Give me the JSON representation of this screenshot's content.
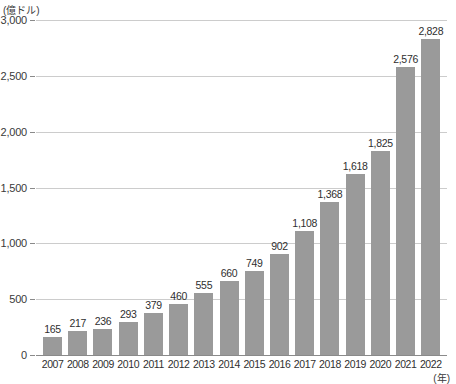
{
  "chart_data": {
    "type": "bar",
    "title": "",
    "subtitle": "",
    "xlabel": "(年)",
    "ylabel": "(億ドル)",
    "categories": [
      "2007",
      "2008",
      "2009",
      "2010",
      "2011",
      "2012",
      "2013",
      "2014",
      "2015",
      "2016",
      "2017",
      "2018",
      "2019",
      "2020",
      "2021",
      "2022"
    ],
    "values": [
      165,
      217,
      236,
      293,
      379,
      460,
      555,
      660,
      749,
      902,
      1108,
      1368,
      1618,
      1825,
      2576,
      2828
    ],
    "value_labels": [
      "165",
      "217",
      "236",
      "293",
      "379",
      "460",
      "555",
      "660",
      "749",
      "902",
      "1,108",
      "1,368",
      "1,618",
      "1,825",
      "2,576",
      "2,828"
    ],
    "ylim": [
      0,
      3000
    ],
    "yticks": [
      0,
      500,
      1000,
      1500,
      2000,
      2500,
      3000
    ],
    "ytick_labels": [
      "0",
      "500",
      "1,000",
      "1,500",
      "2,000",
      "2,500",
      "3,000"
    ],
    "grid": true,
    "legend": "none",
    "bar_color": "#9a9a9a",
    "grid_color": "#cccccc",
    "axis_color": "#8a8a8a"
  }
}
